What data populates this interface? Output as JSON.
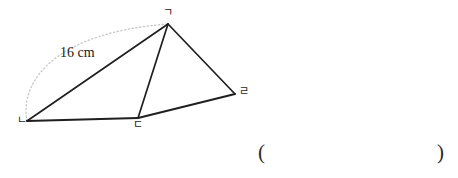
{
  "figure": {
    "type": "geometry-diagram",
    "vertices": [
      {
        "id": "giyeok",
        "label": "ㄱ",
        "x": 168,
        "y": 24
      },
      {
        "id": "nieun",
        "label": "ㄴ",
        "x": 27,
        "y": 121
      },
      {
        "id": "digeut",
        "label": "ㄷ",
        "x": 138,
        "y": 118
      },
      {
        "id": "rieul",
        "label": "ㄹ",
        "x": 235,
        "y": 94
      }
    ],
    "solid_edges": [
      {
        "name": "edge-nieun-giyeok",
        "from": "nieun",
        "to": "giyeok"
      },
      {
        "name": "edge-giyeok-digeut",
        "from": "giyeok",
        "to": "digeut"
      },
      {
        "name": "edge-giyeok-rieul",
        "from": "giyeok",
        "to": "rieul"
      },
      {
        "name": "edge-nieun-digeut",
        "from": "nieun",
        "to": "digeut"
      },
      {
        "name": "edge-digeut-rieul",
        "from": "digeut",
        "to": "rieul"
      }
    ],
    "arc": {
      "name": "measure-arc",
      "from": "nieun",
      "to": "giyeok",
      "path": "M 27 121 C 19 78 60 32 168 24",
      "style": "dotted",
      "color": "#c9c9c9"
    },
    "measure_label": "16 cm",
    "colors": {
      "line": "#1f1f1f",
      "arc": "#c9c9c9",
      "label": "#222222",
      "background": "#ffffff"
    }
  },
  "answer": {
    "open_paren": "(",
    "value": "",
    "close_paren": ")"
  }
}
